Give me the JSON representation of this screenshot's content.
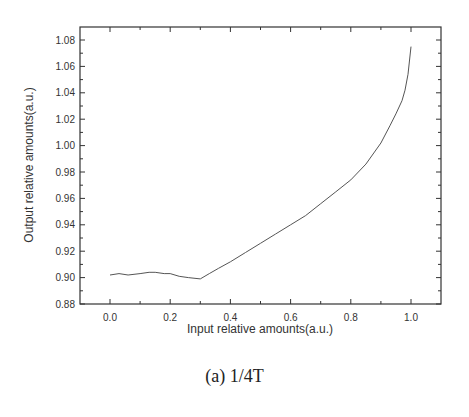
{
  "caption": "(a) 1/4T",
  "chart_data": {
    "type": "line",
    "title": "",
    "xlabel": "Input relative amounts(a.u.)",
    "ylabel": "Output relative amounts(a.u.)",
    "xlim": [
      -0.1,
      1.1
    ],
    "ylim": [
      0.88,
      1.09
    ],
    "xticks": [
      "0.0",
      "0.2",
      "0.4",
      "0.6",
      "0.8",
      "1.0"
    ],
    "yticks": [
      "0.88",
      "0.90",
      "0.92",
      "0.94",
      "0.96",
      "0.98",
      "1.00",
      "1.02",
      "1.04",
      "1.06",
      "1.08"
    ],
    "grid": false,
    "legend": null,
    "series": [
      {
        "name": "1/4T",
        "color": "#555555",
        "x": [
          0.0,
          0.03,
          0.06,
          0.1,
          0.13,
          0.15,
          0.18,
          0.2,
          0.23,
          0.26,
          0.3,
          0.33,
          0.36,
          0.4,
          0.45,
          0.5,
          0.55,
          0.6,
          0.65,
          0.7,
          0.75,
          0.8,
          0.85,
          0.9,
          0.93,
          0.95,
          0.97,
          0.98,
          0.99,
          1.0
        ],
        "y": [
          0.902,
          0.903,
          0.902,
          0.903,
          0.904,
          0.904,
          0.903,
          0.903,
          0.901,
          0.9,
          0.899,
          0.903,
          0.907,
          0.912,
          0.919,
          0.926,
          0.933,
          0.94,
          0.947,
          0.956,
          0.965,
          0.974,
          0.986,
          1.002,
          1.015,
          1.024,
          1.034,
          1.042,
          1.054,
          1.075
        ]
      }
    ]
  }
}
